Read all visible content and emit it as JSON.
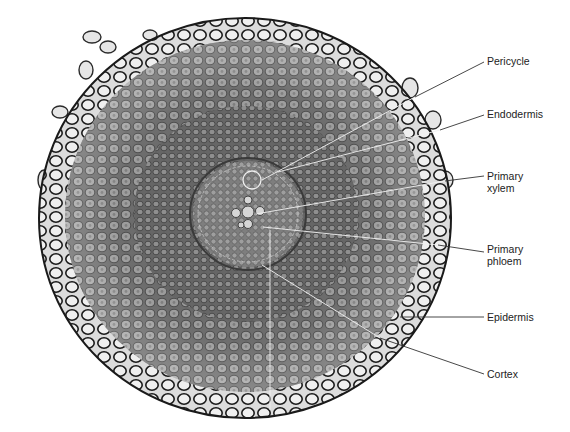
{
  "figure": {
    "colors": {
      "background": "#ffffff",
      "cell_wall": "#1e1e1e",
      "cell_fill_outer": "#e4e4e4",
      "cortex_fill": "#8e8e8e",
      "stele_fill": "#777777",
      "leader_line_outside": "#333333",
      "leader_line_inside": "#f2f2f2",
      "label_text": "#222222"
    },
    "labels": [
      {
        "id": "pericycle",
        "text": "Pericycle",
        "x": 487,
        "y": 55,
        "line_from": [
          484,
          62
        ],
        "line_to": [
          262,
          180
        ]
      },
      {
        "id": "endodermis",
        "text": "Endodermis",
        "x": 487,
        "y": 108,
        "line_from": [
          484,
          115
        ],
        "line_to": [
          278,
          172
        ]
      },
      {
        "id": "primary-xylem",
        "text": "Primary\nxylem",
        "x": 487,
        "y": 162,
        "line_from": [
          484,
          176
        ],
        "line_to": [
          256,
          214
        ]
      },
      {
        "id": "primary-phloem",
        "text": "Primary\nphloem",
        "x": 487,
        "y": 240,
        "line_from": [
          484,
          252
        ],
        "line_to": [
          263,
          227
        ]
      },
      {
        "id": "epidermis",
        "text": "Epidermis",
        "x": 487,
        "y": 311,
        "line_from": [
          484,
          317
        ],
        "line_to": [
          400,
          317
        ]
      },
      {
        "id": "cortex",
        "text": "Cortex",
        "x": 487,
        "y": 369,
        "line_from": [
          484,
          374
        ],
        "line_to": [
          262,
          265
        ]
      }
    ]
  }
}
